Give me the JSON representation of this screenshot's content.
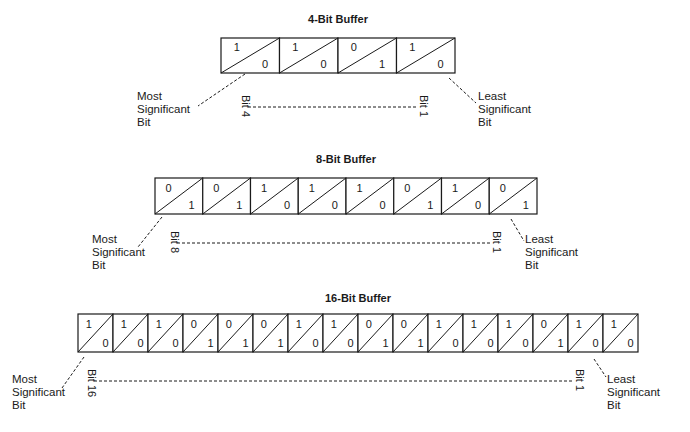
{
  "buffers": [
    {
      "title": "4-Bit Buffer",
      "top_bits": [
        "1",
        "1",
        "0",
        "1"
      ],
      "bottom_bits": [
        "0",
        "0",
        "1",
        "0"
      ],
      "bit_high_label": "Bit 4",
      "bit_low_label": "Bit 1",
      "msb_label": [
        "Most",
        "Significant",
        "Bit"
      ],
      "lsb_label": [
        "Least",
        "Significant",
        "Bit"
      ]
    },
    {
      "title": "8-Bit Buffer",
      "top_bits": [
        "0",
        "0",
        "1",
        "1",
        "1",
        "0",
        "1",
        "0"
      ],
      "bottom_bits": [
        "1",
        "1",
        "0",
        "0",
        "0",
        "1",
        "0",
        "1"
      ],
      "bit_high_label": "Bit 8",
      "bit_low_label": "Bit 1",
      "msb_label": [
        "Most",
        "Significant",
        "Bit"
      ],
      "lsb_label": [
        "Least",
        "Significant",
        "Bit"
      ]
    },
    {
      "title": "16-Bit Buffer",
      "top_bits": [
        "1",
        "1",
        "1",
        "0",
        "0",
        "0",
        "1",
        "1",
        "0",
        "0",
        "1",
        "1",
        "1",
        "0",
        "1",
        "1"
      ],
      "bottom_bits": [
        "0",
        "0",
        "0",
        "1",
        "1",
        "1",
        "0",
        "0",
        "1",
        "1",
        "0",
        "0",
        "0",
        "1",
        "0",
        "0"
      ],
      "bit_high_label": "Bit 16",
      "bit_low_label": "Bit 1",
      "msb_label": [
        "Most",
        "Significant",
        "Bit"
      ],
      "lsb_label": [
        "Least",
        "Significant",
        "Bit"
      ]
    }
  ],
  "layout": {
    "buffers": [
      {
        "x": 221,
        "y": 38,
        "w": 234,
        "h": 35,
        "title_y": 23,
        "msb_x": 137,
        "msb_y": 100,
        "msb_line": [
          245,
          74,
          198,
          106
        ],
        "lsb_x": 478,
        "lsb_y": 100,
        "lsb_line": [
          449,
          78,
          476,
          103
        ],
        "bit_hi_x": 246,
        "bit_lo_x": 424,
        "bit_y": 95
      },
      {
        "x": 155,
        "y": 178,
        "w": 382,
        "h": 36,
        "title_y": 163,
        "msb_x": 92,
        "msb_y": 243,
        "msb_line": [
          162,
          217,
          138,
          247
        ],
        "lsb_x": 525,
        "lsb_y": 243,
        "lsb_line": [
          511,
          219,
          524,
          241
        ],
        "bit_hi_x": 175,
        "bit_lo_x": 497,
        "bit_y": 231
      },
      {
        "x": 78,
        "y": 314,
        "w": 560,
        "h": 38,
        "title_y": 302,
        "msb_x": 12,
        "msb_y": 383,
        "msb_line": [
          84,
          357,
          62,
          388
        ],
        "lsb_x": 607,
        "lsb_y": 383,
        "lsb_line": [
          594,
          359,
          606,
          377
        ],
        "bit_hi_x": 92,
        "bit_lo_x": 580,
        "bit_y": 369
      }
    ]
  }
}
